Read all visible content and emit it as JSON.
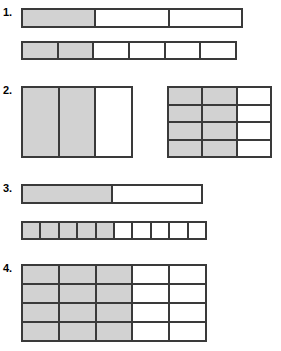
{
  "page": {
    "background_color": "#ffffff",
    "line_color": "#3a3a3a",
    "shade_color": "#d2d2d2"
  },
  "problems": [
    {
      "number": "1.",
      "models": [
        {
          "name": "bar-1a",
          "columns": 3,
          "rows": 1,
          "shaded_columns": 1,
          "shaded_count": 1,
          "total_count": 3,
          "fraction": "1/3",
          "x": 21,
          "y": 8,
          "width": 222,
          "height": 20
        },
        {
          "name": "bar-1b",
          "columns": 6,
          "rows": 1,
          "shaded_columns": 2,
          "shaded_count": 2,
          "total_count": 6,
          "fraction": "2/6",
          "x": 21,
          "y": 41,
          "width": 216,
          "height": 19
        }
      ]
    },
    {
      "number": "2.",
      "models": [
        {
          "name": "grid-2a",
          "columns": 3,
          "rows": 1,
          "shaded_columns": 2,
          "shaded_count": 2,
          "total_count": 3,
          "fraction": "2/3",
          "x": 21,
          "y": 86,
          "width": 112,
          "height": 72
        },
        {
          "name": "grid-2b",
          "columns": 3,
          "rows": 4,
          "shaded_columns": 2,
          "shaded_count": 8,
          "total_count": 12,
          "fraction": "8/12",
          "x": 167,
          "y": 86,
          "width": 105,
          "height": 72
        }
      ]
    },
    {
      "number": "3.",
      "models": [
        {
          "name": "bar-3a",
          "columns": 2,
          "rows": 1,
          "shaded_columns": 1,
          "shaded_count": 1,
          "total_count": 2,
          "fraction": "1/2",
          "x": 21,
          "y": 184,
          "width": 182,
          "height": 20
        },
        {
          "name": "bar-3b",
          "columns": 10,
          "rows": 1,
          "shaded_columns": 5,
          "shaded_count": 5,
          "total_count": 10,
          "fraction": "5/10",
          "x": 21,
          "y": 221,
          "width": 186,
          "height": 19
        }
      ]
    },
    {
      "number": "4.",
      "models": [
        {
          "name": "grid-4a",
          "columns": 5,
          "rows": 4,
          "shaded_columns": 3,
          "shaded_count": 12,
          "total_count": 20,
          "fraction": "12/20",
          "x": 21,
          "y": 264,
          "width": 186,
          "height": 78
        }
      ]
    }
  ]
}
